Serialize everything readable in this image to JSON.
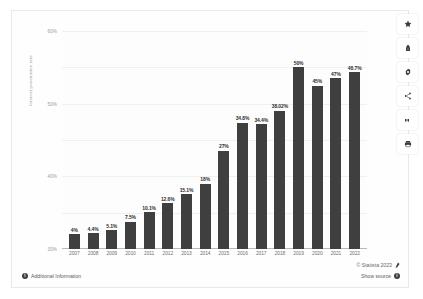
{
  "top_sliver_text": "",
  "chart_data": {
    "type": "bar",
    "title": "",
    "subtitle": "",
    "xlabel": "",
    "ylabel": "Internet penetration rate",
    "ylim": [
      0,
      60
    ],
    "ytick_labels": [
      "60%",
      "50%",
      "40%",
      "30%",
      "20%",
      "10%",
      "0%"
    ],
    "ytick_values": [
      60,
      50,
      40,
      30,
      20,
      10,
      0
    ],
    "grid": true,
    "legend": "none",
    "categories": [
      "2007",
      "2008",
      "2009",
      "2010",
      "2011",
      "2012",
      "2013",
      "2014",
      "2015",
      "2016",
      "2017",
      "2018",
      "2019",
      "2020",
      "2021",
      "2022"
    ],
    "values": [
      4,
      4.4,
      5.1,
      7.5,
      10.1,
      12.6,
      15.1,
      18,
      27,
      34.8,
      34.4,
      38.02,
      50,
      45,
      47,
      48.7
    ],
    "data_labels": [
      "4%",
      "4.4%",
      "5.1%",
      "7.5%",
      "10.1%",
      "12.6%",
      "15.1%",
      "18%",
      "27%",
      "34.8%",
      "34.4%",
      "38.02%",
      "50%",
      "45%",
      "47%",
      "48.7%"
    ],
    "bar_color": "#3f3f3f",
    "plot_background": "#fdfdfd",
    "gridline_color": "#f0f0f0"
  },
  "footer": {
    "additional_information": "Additional Information",
    "copyright": "© Statista 2023",
    "show_source": "Show source"
  },
  "toolbar": {
    "items": [
      {
        "name": "favorite",
        "icon": "star-icon"
      },
      {
        "name": "lock",
        "icon": "lock-icon"
      },
      {
        "name": "settings",
        "icon": "gear-icon"
      },
      {
        "name": "share",
        "icon": "share-icon"
      },
      {
        "name": "cite",
        "icon": "quote-icon"
      },
      {
        "name": "print",
        "icon": "print-icon"
      }
    ]
  }
}
